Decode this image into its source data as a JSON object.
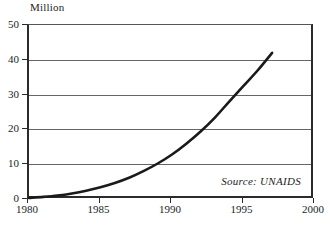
{
  "chart_data": {
    "type": "line",
    "title": "",
    "subtitle": "",
    "unit_label": "Million",
    "xlabel": "",
    "ylabel": "Million",
    "xlim": [
      1980,
      2000
    ],
    "ylim": [
      0,
      50
    ],
    "grid": true,
    "legend": null,
    "x_ticks": [
      "1980",
      "1985",
      "1990",
      "1995",
      "2000"
    ],
    "x_tick_values": [
      1980,
      1985,
      1990,
      1995,
      2000
    ],
    "y_ticks": [
      "0",
      "10",
      "20",
      "30",
      "40",
      "50"
    ],
    "y_tick_values": [
      0,
      10,
      20,
      30,
      40,
      50
    ],
    "annotations": [
      {
        "text": "Source: UNAIDS",
        "position": "bottom-right",
        "style": "italic"
      }
    ],
    "series": [
      {
        "name": "People living with HIV/AIDS",
        "x": [
          1980,
          1981,
          1982,
          1983,
          1984,
          1985,
          1986,
          1987,
          1988,
          1989,
          1990,
          1991,
          1992,
          1993,
          1994,
          1995,
          1996,
          1997
        ],
        "values": [
          0.3,
          0.6,
          1.0,
          1.6,
          2.4,
          3.4,
          4.6,
          6.1,
          8.0,
          10.2,
          12.8,
          15.9,
          19.4,
          23.4,
          28.0,
          32.5,
          37.0,
          42.0
        ]
      }
    ]
  },
  "chart": {
    "unit_label": "Million",
    "source_note": "Source: UNAIDS"
  }
}
